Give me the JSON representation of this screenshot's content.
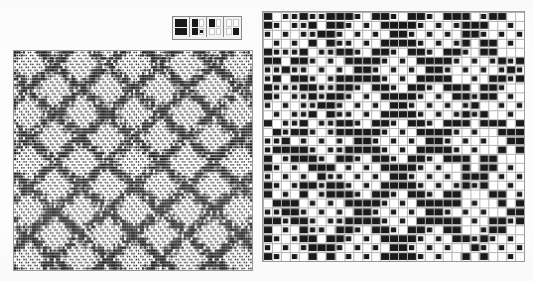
{
  "figure": {
    "background_color": "#fdfdfd",
    "ink_color": "#1a1a1a",
    "grid_line_color": "#b4b4b4",
    "border_color": "#9a9a9a"
  },
  "legend": {
    "name": "pattern-key",
    "border_color": "#8a8a8a",
    "tiles": [
      {
        "label": "full-dark-bars",
        "quadrants": [
          "wide-on",
          "wide-on"
        ],
        "description": "Two full-width black bars, top and bottom"
      },
      {
        "label": "left-dark-with-dot",
        "quadrants": [
          "on",
          "off",
          "on",
          "dot"
        ],
        "description": "Top-left and bottom-left black, small dot bottom-right"
      },
      {
        "label": "top-left-dark",
        "quadrants": [
          "on",
          "off",
          "off",
          "off"
        ],
        "description": "Top-left quadrant black only"
      },
      {
        "label": "bottom-right-dark",
        "quadrants": [
          "off",
          "off",
          "off",
          "on"
        ],
        "description": "Bottom-right quadrant black only"
      }
    ]
  },
  "panels": [
    {
      "name": "draft-fine",
      "position": "left",
      "x": 13,
      "y": 50,
      "width": 240,
      "height": 221,
      "cols": 108,
      "rows": 74,
      "cell_w": 2.22,
      "cell_h": 2.99,
      "style": "fine",
      "description": "Dense fine-grained weaving draft with horizontal dash striping and diagonal diamond motifs"
    },
    {
      "name": "draft-coarse",
      "position": "right",
      "x": 262,
      "y": 11,
      "width": 263,
      "height": 251,
      "cols": 29,
      "rows": 28,
      "cell_w": 9.07,
      "cell_h": 8.96,
      "style": "coarse",
      "description": "Magnified weave grid of black and white cells forming a central star/diamond motif"
    }
  ],
  "chart_data": {
    "type": "heatmap",
    "xlabel": "",
    "ylabel": "",
    "grid": true,
    "legend_position": "top",
    "legend_entries": [
      "full-dark-bars",
      "left-dark-with-dot",
      "top-left-dark",
      "bottom-right-dark"
    ]
  }
}
